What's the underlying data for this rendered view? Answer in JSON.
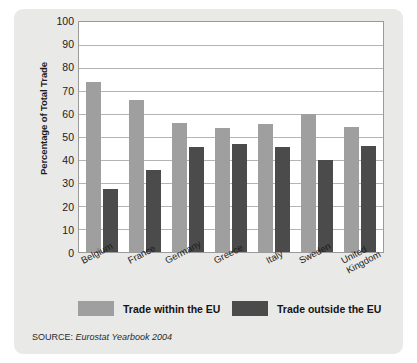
{
  "chart_data": {
    "type": "bar",
    "title": "",
    "xlabel": "",
    "ylabel": "Percentage of Total Trade",
    "ylim": [
      0,
      100
    ],
    "ytick_step": 10,
    "grid": true,
    "legend_position": "bottom",
    "categories": [
      "Belgium",
      "France",
      "Germany",
      "Greece",
      "Italy",
      "Sweden",
      "United Kingdom"
    ],
    "category_lines": [
      [
        "Belgium"
      ],
      [
        "France"
      ],
      [
        "Germany"
      ],
      [
        "Greece"
      ],
      [
        "Italy"
      ],
      [
        "Sweden"
      ],
      [
        "United",
        "Kingdom"
      ]
    ],
    "yticks": [
      "0",
      "10",
      "20",
      "30",
      "40",
      "50",
      "60",
      "70",
      "80",
      "90",
      "100"
    ],
    "ytick_values": [
      0,
      10,
      20,
      30,
      40,
      50,
      60,
      70,
      80,
      90,
      100
    ],
    "series": [
      {
        "name": "Trade within the EU",
        "color": "#9f9f9f",
        "values": [
          74,
          66,
          56,
          54,
          55.5,
          60,
          54.5
        ]
      },
      {
        "name": "Trade outside the EU",
        "color": "#4b4b4b",
        "values": [
          27.5,
          35.5,
          45.5,
          47,
          45.5,
          40,
          46
        ]
      }
    ],
    "source_prefix": "SOURCE:",
    "source_reference": "Eurostat Yearbook 2004"
  },
  "legend": {
    "within_label": "Trade within the EU",
    "outside_label": "Trade outside the EU"
  },
  "axis": {
    "y_title": "Percentage of Total Trade"
  },
  "source": {
    "prefix": "SOURCE:",
    "reference": "Eurostat Yearbook 2004"
  }
}
